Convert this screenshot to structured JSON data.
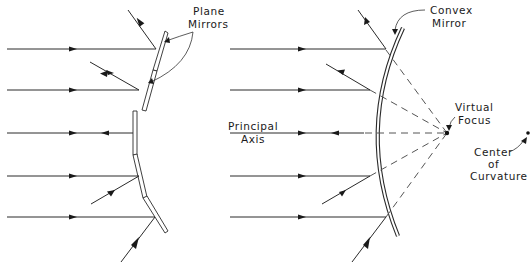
{
  "figure": {
    "left_panel": {
      "title_label": [
        "Plane",
        "Mirrors"
      ],
      "rays_y": [
        49,
        90,
        133,
        176,
        217
      ]
    },
    "right_panel": {
      "mirror_label": [
        "Convex",
        "Mirror"
      ],
      "axis_label": [
        "Principal",
        "Axis"
      ],
      "focus_label": [
        "Virtual",
        "Focus"
      ],
      "center_label": [
        "Center",
        "of",
        "Curvature"
      ],
      "rays_y": [
        49,
        90,
        133,
        176,
        217
      ]
    },
    "colors": {
      "line": "#2a2a2a",
      "background": "#ffffff"
    }
  }
}
